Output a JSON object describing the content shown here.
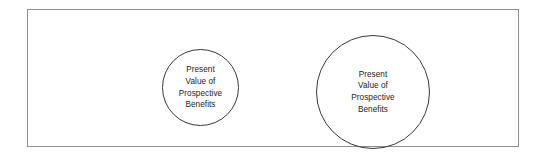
{
  "figure": {
    "background_color": "#ffffff",
    "frame": {
      "name": "diagram-frame",
      "border_color": "#8f8f8f"
    },
    "circles": [
      {
        "id": "small",
        "name": "circle-small",
        "outline_color": "#3a3a3a",
        "fill_color": "none",
        "diameter_px": 77,
        "center_x_px": 172,
        "center_y_px": 77,
        "label_lines": [
          "Present",
          "Value of",
          "Prospective",
          "Benefits"
        ]
      },
      {
        "id": "large",
        "name": "circle-large",
        "outline_color": "#3a3a3a",
        "fill_color": "none",
        "diameter_px": 114,
        "center_x_px": 345,
        "center_y_px": 82,
        "label_lines": [
          "Present",
          "Value of",
          "Prospective",
          "Benefits"
        ]
      }
    ]
  }
}
